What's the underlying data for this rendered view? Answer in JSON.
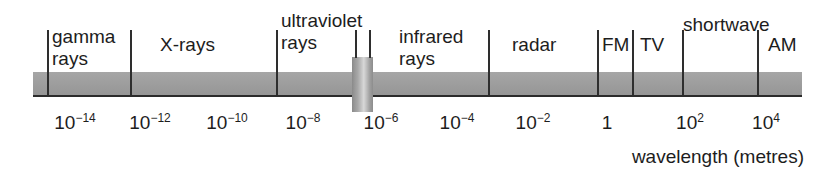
{
  "figure": {
    "axis_caption": "wavelength (metres)",
    "bar_color": "#9d9d9d",
    "baseline_color": "#2b2b2b",
    "divider_color": "#2e2e2e"
  },
  "chart_data": {
    "type": "bar",
    "xlabel": "wavelength (metres)",
    "ylabel": "",
    "grid": false,
    "legend": "none",
    "scale": "log10",
    "xlim": [
      -15,
      5
    ],
    "tick_labels": [
      "10⁻¹⁴",
      "10⁻¹²",
      "10⁻¹⁰",
      "10⁻⁸",
      "10⁻⁶",
      "10⁻⁴",
      "10⁻²",
      "1",
      "10²",
      "10⁴"
    ],
    "ticks": [
      {
        "mantissa": "10",
        "exponent": "−14",
        "value": -14,
        "x": 75
      },
      {
        "mantissa": "10",
        "exponent": "−12",
        "value": -12,
        "x": 150
      },
      {
        "mantissa": "10",
        "exponent": "−10",
        "value": -10,
        "x": 227
      },
      {
        "mantissa": "10",
        "exponent": "−8",
        "value": -8,
        "x": 303
      },
      {
        "mantissa": "10",
        "exponent": "−6",
        "value": -6,
        "x": 381
      },
      {
        "mantissa": "10",
        "exponent": "−4",
        "value": -4,
        "x": 457
      },
      {
        "mantissa": "10",
        "exponent": "−2",
        "value": -2,
        "x": 533
      },
      {
        "mantissa": "1",
        "exponent": "",
        "value": 0,
        "x": 607
      },
      {
        "mantissa": "10",
        "exponent": "2",
        "value": 2,
        "x": 690
      },
      {
        "mantissa": "10",
        "exponent": "4",
        "value": 4,
        "x": 766
      }
    ],
    "categories": [
      "gamma rays",
      "X-rays",
      "ultraviolet rays",
      "visible light",
      "infrared rays",
      "radar",
      "FM",
      "TV",
      "shortwave",
      "AM"
    ],
    "bands": [
      {
        "name": "gamma rays",
        "line1": "gamma",
        "line2": "rays",
        "label_x": 52,
        "label_y": 26,
        "start_x": 47,
        "end_x": 130
      },
      {
        "name": "X-rays",
        "line1": "X-rays",
        "line2": "",
        "label_x": 160,
        "label_y": 34,
        "start_x": 130,
        "end_x": 276
      },
      {
        "name": "ultraviolet rays",
        "line1": "ultraviolet",
        "line2": "rays",
        "label_x": 281,
        "label_y": 10,
        "start_x": 276,
        "end_x": 352
      },
      {
        "name": "visible light",
        "line1": "",
        "line2": "",
        "label_x": 0,
        "label_y": 0,
        "start_x": 352,
        "end_x": 373
      },
      {
        "name": "infrared rays",
        "line1": "infrared",
        "line2": "rays",
        "label_x": 399,
        "label_y": 26,
        "start_x": 373,
        "end_x": 488
      },
      {
        "name": "radar",
        "line1": "radar",
        "line2": "",
        "label_x": 512,
        "label_y": 34,
        "start_x": 488,
        "end_x": 597
      },
      {
        "name": "FM",
        "line1": "FM",
        "line2": "",
        "label_x": 602,
        "label_y": 34,
        "start_x": 597,
        "end_x": 632
      },
      {
        "name": "TV",
        "line1": "TV",
        "line2": "",
        "label_x": 640,
        "label_y": 34,
        "start_x": 632,
        "end_x": 682
      },
      {
        "name": "shortwave",
        "line1": "shortwave",
        "line2": "",
        "label_x": 683,
        "label_y": 14,
        "start_x": 682,
        "end_x": 757
      },
      {
        "name": "AM",
        "line1": "AM",
        "line2": "",
        "label_x": 768,
        "label_y": 34,
        "start_x": 757,
        "end_x": 802
      }
    ],
    "dividers": [
      {
        "name": "divider-gamma-start",
        "x": 47,
        "top": 30,
        "height": 65
      },
      {
        "name": "divider-gamma-xrays",
        "x": 130,
        "top": 30,
        "height": 65
      },
      {
        "name": "divider-xrays-uv",
        "x": 276,
        "top": 30,
        "height": 65
      },
      {
        "name": "divider-infrared-radar",
        "x": 488,
        "top": 30,
        "height": 65
      },
      {
        "name": "divider-radar-fm",
        "x": 597,
        "top": 30,
        "height": 65
      },
      {
        "name": "divider-fm-tv",
        "x": 632,
        "top": 30,
        "height": 65
      },
      {
        "name": "divider-tv-shortwave",
        "x": 682,
        "top": 30,
        "height": 65
      },
      {
        "name": "divider-shortwave-am",
        "x": 757,
        "top": 30,
        "height": 65
      }
    ],
    "visible_band": {
      "name": "visible light",
      "x": 352,
      "width": 21,
      "top": 57,
      "height": 55,
      "tick_left_x": 355,
      "tick_right_x": 369
    }
  }
}
